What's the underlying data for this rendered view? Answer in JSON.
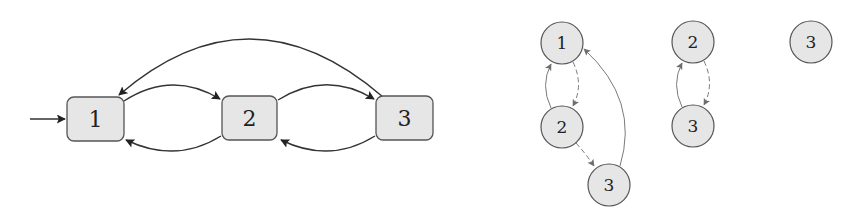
{
  "colors": {
    "node_fill": "#e6e6e6",
    "node_stroke": "#555555",
    "edge_dark": "#333333",
    "edge_gray": "#7a7a7a",
    "background": "#ffffff"
  },
  "automaton": {
    "initial_state": "1",
    "states": [
      {
        "id": "1",
        "label": "1"
      },
      {
        "id": "2",
        "label": "2"
      },
      {
        "id": "3",
        "label": "3"
      }
    ],
    "transitions": [
      {
        "from": "1",
        "to": "2"
      },
      {
        "from": "2",
        "to": "1"
      },
      {
        "from": "2",
        "to": "3"
      },
      {
        "from": "3",
        "to": "2"
      },
      {
        "from": "3",
        "to": "1"
      }
    ]
  },
  "trees": [
    {
      "nodes": [
        {
          "id": "t1n1",
          "label": "1"
        },
        {
          "id": "t1n2",
          "label": "2"
        },
        {
          "id": "t1n3",
          "label": "3"
        }
      ],
      "edges": [
        {
          "from": "1",
          "to": "2",
          "style": "dashed"
        },
        {
          "from": "2",
          "to": "1",
          "style": "solid"
        },
        {
          "from": "2",
          "to": "3",
          "style": "dashed"
        },
        {
          "from": "3",
          "to": "1",
          "style": "solid"
        }
      ]
    },
    {
      "nodes": [
        {
          "id": "t2n2",
          "label": "2"
        },
        {
          "id": "t2n3",
          "label": "3"
        }
      ],
      "edges": [
        {
          "from": "2",
          "to": "3",
          "style": "dashed"
        },
        {
          "from": "3",
          "to": "2",
          "style": "solid"
        }
      ]
    },
    {
      "nodes": [
        {
          "id": "t3n3",
          "label": "3"
        }
      ],
      "edges": []
    }
  ]
}
